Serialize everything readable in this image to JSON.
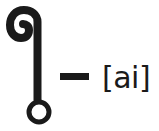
{
  "glyph": {
    "name": "thai-vowel-sara-ai-maimalai",
    "color": "#1a1a1a"
  },
  "separator": "–",
  "pronunciation": "[ai]"
}
